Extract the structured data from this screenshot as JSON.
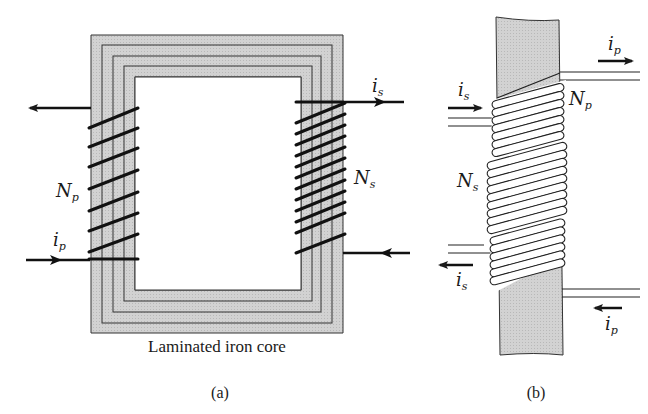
{
  "figure_a": {
    "caption": "(a)",
    "core_label": "Laminated iron core",
    "primary_turns_label": "N",
    "primary_turns_sub": "p",
    "secondary_turns_label": "N",
    "secondary_turns_sub": "s",
    "primary_current_label": "i",
    "primary_current_sub": "p",
    "secondary_current_label": "i",
    "secondary_current_sub": "s"
  },
  "figure_b": {
    "caption": "(b)",
    "primary_turns_label": "N",
    "primary_turns_sub": "p",
    "secondary_turns_label": "N",
    "secondary_turns_sub": "s",
    "primary_current_in_label": "i",
    "primary_current_in_sub": "p",
    "primary_current_out_label": "i",
    "primary_current_out_sub": "p",
    "secondary_current_in_label": "i",
    "secondary_current_in_sub": "s",
    "secondary_current_out_label": "i",
    "secondary_current_out_sub": "s"
  },
  "colors": {
    "core_fill": "#cfcfcf",
    "line": "#1a1a1a",
    "coil_fill": "#ffffff"
  }
}
